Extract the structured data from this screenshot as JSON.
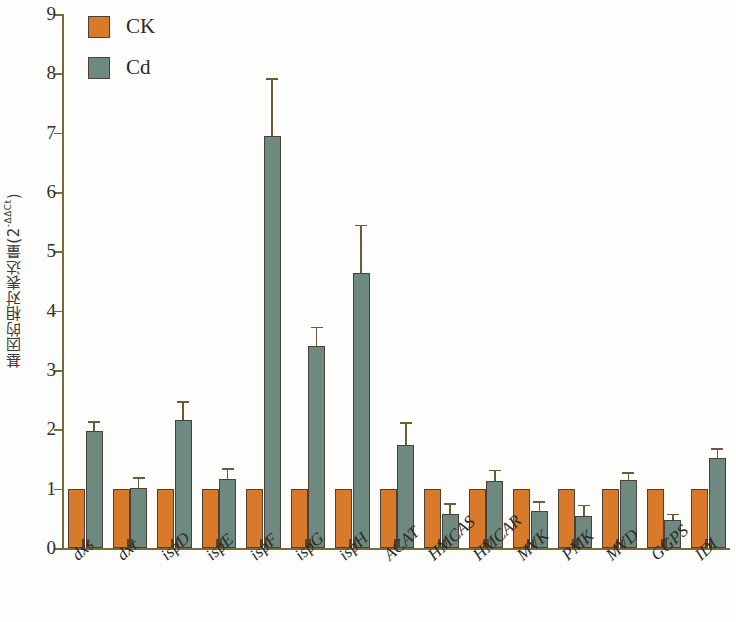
{
  "chart_data": {
    "type": "bar",
    "title": "",
    "subtitle": "",
    "xlabel": "",
    "ylabel": "基因的相对表达量(2-ΔΔCt)",
    "ylabel_base": "基因的相对表达量(2",
    "ylabel_sup": "-ΔΔCt",
    "ylabel_tail": ")",
    "ylim": [
      0,
      9
    ],
    "yticks": [
      0,
      1,
      2,
      3,
      4,
      5,
      6,
      7,
      8,
      9
    ],
    "ytick_labels": [
      "0",
      "1",
      "2",
      "3",
      "4",
      "5",
      "6",
      "7",
      "8",
      "9"
    ],
    "grid": false,
    "legend_position": "top-left",
    "error_bars": "standard deviation",
    "categories": [
      "dxs",
      "dxr",
      "ispD",
      "ispE",
      "ispF",
      "ispG",
      "ispH",
      "ACAT",
      "HMCAS",
      "HMCAR",
      "MVK",
      "PMK",
      "MVD",
      "GGPS",
      "IDI"
    ],
    "series": [
      {
        "name": "CK",
        "color": "#d97a2b",
        "values": [
          1.0,
          1.0,
          1.0,
          1.0,
          1.0,
          1.0,
          1.0,
          1.0,
          1.0,
          1.0,
          1.0,
          1.0,
          1.0,
          1.0,
          1.0
        ],
        "errors": [
          0,
          0,
          0,
          0,
          0,
          0,
          0,
          0,
          0,
          0,
          0,
          0,
          0,
          0,
          0
        ]
      },
      {
        "name": "Cd",
        "color": "#6e8a80",
        "values": [
          1.97,
          1.01,
          2.15,
          1.16,
          6.95,
          3.4,
          4.63,
          1.74,
          0.57,
          1.13,
          0.62,
          0.54,
          1.15,
          0.48,
          1.52
        ],
        "errors": [
          0.17,
          0.19,
          0.33,
          0.18,
          0.97,
          0.33,
          0.82,
          0.38,
          0.19,
          0.19,
          0.17,
          0.19,
          0.13,
          0.1,
          0.16
        ]
      }
    ]
  },
  "legend": {
    "items": [
      {
        "label": "CK",
        "color": "#d97a2b"
      },
      {
        "label": "Cd",
        "color": "#6e8a80"
      }
    ]
  },
  "axis": {
    "y_min_label": "0",
    "y_max_label": "9"
  }
}
